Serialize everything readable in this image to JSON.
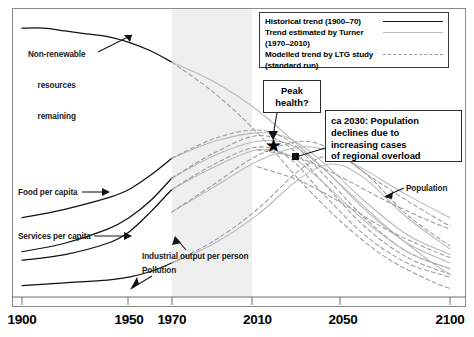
{
  "chart_data": {
    "type": "line",
    "title": "",
    "xlabel": "",
    "ylabel": "",
    "xlim": [
      1900,
      2100
    ],
    "ylim": [
      0,
      100
    ],
    "grid": false,
    "xticks": [
      1900,
      1950,
      1970,
      2010,
      2050,
      2100
    ],
    "xticklabels": [
      "1900",
      "1950",
      "1970",
      "2010",
      "2050",
      "2100"
    ],
    "shaded_region": {
      "label": "Turner comparison period",
      "x_start": 1970,
      "x_end": 2010,
      "color": "#efefef"
    },
    "legend": {
      "position": "top-right",
      "entries": [
        {
          "label": "Historical trend (1900–70)",
          "style": "solid",
          "color": "#111111",
          "width": 1.6
        },
        {
          "label": "Trend estimated by Turner",
          "label2": "(1970–2010)",
          "style": "solid",
          "color": "#b9b9b9",
          "width": 1.1
        },
        {
          "label": "Modelled trend by LTG study",
          "label2": "(standard run)",
          "style": "dashed",
          "color": "#9a9a9a",
          "width": 1.2
        }
      ]
    },
    "annotations": [
      {
        "name": "non-renewable-resources",
        "text": "Non-renewable\nresources\nremaining",
        "x": 1900,
        "y": 95
      },
      {
        "name": "food-per-capita",
        "text": "Food per capita",
        "x": 1902,
        "y": 38
      },
      {
        "name": "services-per-capita",
        "text": "Services per capita",
        "x": 1902,
        "y": 22
      },
      {
        "name": "industrial-output",
        "text": "Industrial output per person",
        "x": 1960,
        "y": 16
      },
      {
        "name": "pollution",
        "text": "Pollution",
        "x": 1960,
        "y": 11
      },
      {
        "name": "population",
        "text": "Population",
        "x": 2075,
        "y": 40
      },
      {
        "name": "peak-health",
        "text": "Peak\nhealth?",
        "x": 2015,
        "y": 72
      },
      {
        "name": "population-decline",
        "text": "ca 2030: Population\ndeclines due to\nincreasing cases\nof regional overload",
        "x": 2033,
        "y": 62
      }
    ],
    "marker": {
      "name": "peak-health-star",
      "symbol": "★",
      "x": 2014,
      "y": 54
    },
    "series": [
      {
        "name": "Non-renewable resources remaining (historical)",
        "style": "solid",
        "color": "#111111",
        "x": [
          1900,
          1910,
          1920,
          1930,
          1940,
          1950,
          1960,
          1970
        ],
        "y": [
          95,
          95,
          94,
          93,
          92,
          90,
          87,
          83
        ]
      },
      {
        "name": "Non-renewable resources remaining (Turner)",
        "style": "solid",
        "color": "#b9b9b9",
        "x": [
          1970,
          1990,
          2010,
          2030,
          2050,
          2070,
          2090,
          2100
        ],
        "y": [
          83,
          76,
          66,
          53,
          39,
          25,
          13,
          8
        ]
      },
      {
        "name": "Non-renewable resources remaining (LTG)",
        "style": "dashed",
        "color": "#9a9a9a",
        "x": [
          1970,
          1990,
          2010,
          2030,
          2050,
          2070,
          2090,
          2100
        ],
        "y": [
          83,
          72,
          58,
          41,
          26,
          14,
          6,
          3
        ]
      },
      {
        "name": "Food per capita (historical)",
        "style": "solid",
        "color": "#111111",
        "x": [
          1900,
          1920,
          1940,
          1950,
          1960,
          1970
        ],
        "y": [
          28,
          31,
          35,
          38,
          43,
          49
        ]
      },
      {
        "name": "Food per capita (Turner)",
        "style": "solid",
        "color": "#b9b9b9",
        "x": [
          1970,
          1990,
          2010,
          2025,
          2040,
          2060,
          2080,
          2100
        ],
        "y": [
          49,
          55,
          58,
          56,
          48,
          34,
          22,
          15
        ]
      },
      {
        "name": "Food per capita (LTG)",
        "style": "dashed",
        "color": "#9a9a9a",
        "x": [
          1970,
          1990,
          2010,
          2025,
          2040,
          2060,
          2080,
          2100
        ],
        "y": [
          49,
          56,
          59,
          55,
          44,
          28,
          16,
          10
        ]
      },
      {
        "name": "Services per capita (historical)",
        "style": "solid",
        "color": "#111111",
        "x": [
          1900,
          1920,
          1940,
          1950,
          1960,
          1970
        ],
        "y": [
          16,
          19,
          24,
          28,
          34,
          42
        ]
      },
      {
        "name": "Services per capita (Turner)",
        "style": "solid",
        "color": "#b9b9b9",
        "x": [
          1970,
          1990,
          2010,
          2025,
          2040,
          2060,
          2080,
          2100
        ],
        "y": [
          42,
          50,
          55,
          54,
          46,
          31,
          19,
          12
        ]
      },
      {
        "name": "Services per capita (LTG)",
        "style": "dashed",
        "color": "#9a9a9a",
        "x": [
          1970,
          1990,
          2010,
          2025,
          2040,
          2060,
          2080,
          2100
        ],
        "y": [
          42,
          51,
          57,
          53,
          41,
          25,
          14,
          8
        ]
      },
      {
        "name": "Industrial output per person (historical)",
        "style": "solid",
        "color": "#111111",
        "x": [
          1900,
          1920,
          1940,
          1950,
          1960,
          1970
        ],
        "y": [
          13,
          15,
          19,
          23,
          30,
          38
        ]
      },
      {
        "name": "Industrial output per person (Turner)",
        "style": "solid",
        "color": "#b9b9b9",
        "x": [
          1970,
          1990,
          2010,
          2025,
          2040,
          2060,
          2080,
          2100
        ],
        "y": [
          38,
          46,
          52,
          50,
          41,
          27,
          16,
          10
        ]
      },
      {
        "name": "Industrial output per person (LTG)",
        "style": "dashed",
        "color": "#9a9a9a",
        "x": [
          1970,
          1990,
          2010,
          2025,
          2040,
          2060,
          2080,
          2100
        ],
        "y": [
          38,
          47,
          53,
          49,
          37,
          22,
          12,
          7
        ]
      },
      {
        "name": "Pollution (historical)",
        "style": "solid",
        "color": "#111111",
        "x": [
          1900,
          1920,
          1940,
          1950,
          1960,
          1970
        ],
        "y": [
          4,
          5,
          6,
          7,
          9,
          12
        ]
      },
      {
        "name": "Pollution (Turner)",
        "style": "solid",
        "color": "#b9b9b9",
        "x": [
          1970,
          1990,
          2010,
          2030,
          2045,
          2060,
          2080,
          2100
        ],
        "y": [
          12,
          19,
          29,
          42,
          47,
          42,
          28,
          17
        ]
      },
      {
        "name": "Pollution (LTG)",
        "style": "dashed",
        "color": "#9a9a9a",
        "x": [
          1970,
          1990,
          2010,
          2030,
          2045,
          2060,
          2080,
          2100
        ],
        "y": [
          12,
          20,
          31,
          45,
          50,
          44,
          29,
          18
        ]
      },
      {
        "name": "Population (Turner)",
        "style": "solid",
        "color": "#b9b9b9",
        "x": [
          1970,
          1990,
          2010,
          2030,
          2045,
          2060,
          2080,
          2100
        ],
        "y": [
          30,
          39,
          48,
          53,
          51,
          45,
          36,
          28
        ]
      },
      {
        "name": "Population (LTG)",
        "style": "dashed",
        "color": "#9a9a9a",
        "x": [
          1970,
          1990,
          2010,
          2030,
          2045,
          2060,
          2080,
          2100
        ],
        "y": [
          30,
          40,
          50,
          55,
          52,
          44,
          34,
          25
        ]
      },
      {
        "name": "Population right branch A",
        "style": "dashed",
        "color": "#9a9a9a",
        "x": [
          2010,
          2030,
          2050,
          2070,
          2090,
          2100
        ],
        "y": [
          52,
          49,
          42,
          34,
          27,
          24
        ]
      },
      {
        "name": "Population right branch B",
        "style": "dashed",
        "color": "#9a9a9a",
        "x": [
          2010,
          2030,
          2050,
          2070,
          2090,
          2100
        ],
        "y": [
          46,
          41,
          33,
          24,
          17,
          14
        ]
      }
    ]
  },
  "axis": {
    "ticks": [
      {
        "label": "1900",
        "value": 1900
      },
      {
        "label": "1950",
        "value": 1950
      },
      {
        "label": "1970",
        "value": 1970
      },
      {
        "label": "2010",
        "value": 2010
      },
      {
        "label": "2050",
        "value": 2050
      },
      {
        "label": "2100",
        "value": 2100
      }
    ]
  },
  "legend": {
    "row1_label": "Historical trend (1900–70)",
    "row2_label": "Trend estimated by Turner",
    "row3_label": "(1970–2010)",
    "row4_label": "Modelled trend by LTG study",
    "row5_label": "(standard run)"
  },
  "callouts": {
    "peak_health_line1": "Peak",
    "peak_health_line2": "health?",
    "decline_line1": "ca 2030: Population",
    "decline_line2": "declines due to",
    "decline_line3": "increasing cases",
    "decline_line4": "of regional overload"
  },
  "labels": {
    "nonrenewable_line1": "Non-renewable",
    "nonrenewable_line2": "resources",
    "nonrenewable_line3": "remaining",
    "food": "Food per capita",
    "services": "Services per capita",
    "industrial": "Industrial output per person",
    "pollution": "Pollution",
    "population": "Population"
  },
  "colors": {
    "historical": "#111111",
    "turner": "#b9b9b9",
    "ltg": "#9a9a9a",
    "shade": "#efefef",
    "frame": "#8a8a8a"
  }
}
